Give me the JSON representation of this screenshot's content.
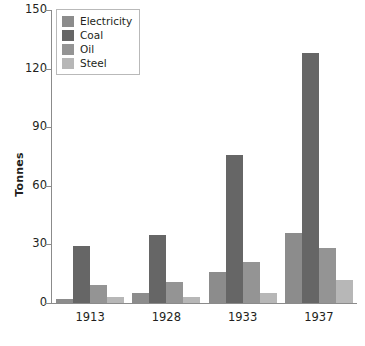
{
  "chart_data": {
    "type": "bar",
    "title": "",
    "subtitle": "",
    "xlabel": "",
    "ylabel": "Tonnes",
    "categories": [
      "1913",
      "1928",
      "1933",
      "1937"
    ],
    "series": [
      {
        "name": "Electricity",
        "color": "#8c8c8c",
        "values": [
          2,
          5,
          16,
          36
        ]
      },
      {
        "name": "Coal",
        "color": "#666666",
        "values": [
          29,
          35,
          76,
          128
        ]
      },
      {
        "name": "Oil",
        "color": "#949494",
        "values": [
          9,
          11,
          21,
          28
        ]
      },
      {
        "name": "Steel",
        "color": "#b7b7b7",
        "values": [
          3,
          3,
          5,
          12
        ]
      }
    ],
    "ylim": [
      0,
      150
    ],
    "yticks": [
      0,
      30,
      60,
      90,
      120,
      150
    ],
    "ytick_labels": [
      "0",
      "30",
      "60",
      "90",
      "120",
      "150"
    ],
    "grid": false,
    "legend_position": "top-left",
    "axis_color": "#8b8b8b"
  },
  "legend": {
    "items": [
      {
        "label": "Electricity"
      },
      {
        "label": "Coal"
      },
      {
        "label": "Oil"
      },
      {
        "label": "Steel"
      }
    ]
  }
}
